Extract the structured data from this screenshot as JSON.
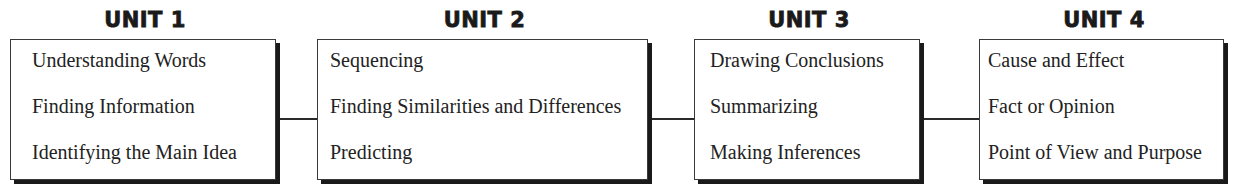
{
  "units": [
    {
      "title": "UNIT 1",
      "skills": [
        "Understanding Words",
        "Finding Information",
        "Identifying the Main Idea"
      ]
    },
    {
      "title": "UNIT 2",
      "skills": [
        "Sequencing",
        "Finding Similarities and Differences",
        "Predicting"
      ]
    },
    {
      "title": "UNIT 3",
      "skills": [
        "Drawing Conclusions",
        "Summarizing",
        "Making Inferences"
      ]
    },
    {
      "title": "UNIT 4",
      "skills": [
        "Cause and Effect",
        "Fact or Opinion",
        "Point of View and Purpose"
      ]
    }
  ]
}
